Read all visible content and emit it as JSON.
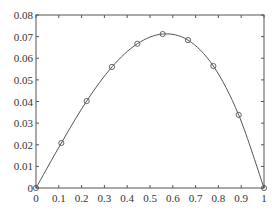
{
  "chart_data": {
    "type": "line",
    "title": "",
    "xlabel": "",
    "ylabel": "",
    "xlim": [
      0,
      1
    ],
    "ylim": [
      0,
      0.08
    ],
    "grid": false,
    "legend": null,
    "x_ticks": [
      "0",
      "0.1",
      "0.2",
      "0.3",
      "0.4",
      "0.5",
      "0.6",
      "0.7",
      "0.8",
      "0.9",
      "1"
    ],
    "y_ticks": [
      "0",
      "0.01",
      "0.02",
      "0.03",
      "0.04",
      "0.05",
      "0.06",
      "0.07",
      "0.08"
    ],
    "series": [
      {
        "name": "curve",
        "style": "smooth line with circle markers",
        "color": "#555555",
        "x": [
          0,
          0.1111,
          0.2222,
          0.3333,
          0.4444,
          0.5556,
          0.6667,
          0.7778,
          0.8889,
          1.0
        ],
        "values": [
          0,
          0.0208,
          0.0402,
          0.056,
          0.0667,
          0.0712,
          0.0684,
          0.0564,
          0.0338,
          0
        ]
      }
    ]
  },
  "colors": {
    "axis": "#555555",
    "line": "#555555",
    "marker": "#555555",
    "text": "#333333"
  }
}
